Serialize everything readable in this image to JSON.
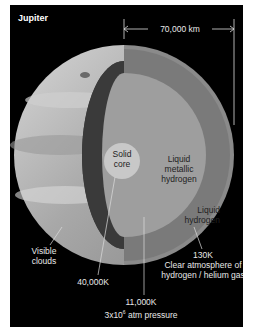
{
  "title": "Jupiter",
  "scale_label": "70,000 km",
  "layers": {
    "core": {
      "line1": "Solid",
      "line2": "core"
    },
    "metallic": {
      "line1": "Liquid",
      "line2": "metallic",
      "line3": "hydrogen"
    },
    "liquid": {
      "line1": "Liquid",
      "line2": "hydrogen"
    }
  },
  "annotations": {
    "clouds": {
      "line1": "Visible",
      "line2": "clouds"
    },
    "core_temp": "40,000K",
    "metallic_boundary": {
      "temp": "11,000K",
      "pressure_base": "3x10",
      "pressure_exp": "6",
      "pressure_unit": " atm pressure"
    },
    "atmosphere": {
      "temp": "130K",
      "line1": "Clear atmosphere of",
      "line2": "hydrogen / helium gas"
    }
  },
  "colors": {
    "background": "#000000",
    "surface": "#b8b8b8",
    "dark_shell": "#3a3a3a",
    "liquid_h": "#7a7a7a",
    "metallic_h": "#9e9e9e",
    "core": "#c8c8c8"
  }
}
